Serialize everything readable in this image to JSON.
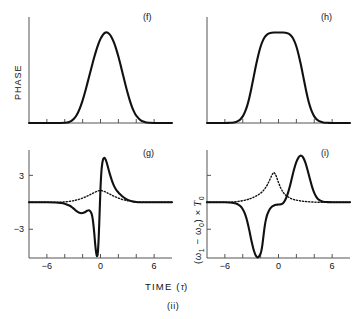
{
  "figure": {
    "caption": "(ii)",
    "axis_labels": {
      "y_top": "PHASE",
      "y_bottom_html": "(ω₁ − ω₀) × T₀",
      "x": "TIME (τ)"
    },
    "panel_tags": {
      "f": "(f)",
      "g": "(g)",
      "h": "(h)",
      "i": "(i)"
    },
    "tick_labels": {
      "x": [
        "−6",
        "0",
        "6"
      ],
      "y_bottom": [
        "3",
        "−3"
      ]
    },
    "colors": {
      "curve": "#111111",
      "axis": "#555555",
      "background": "#ffffff"
    }
  },
  "chart_data": [
    {
      "id": "f",
      "type": "line",
      "title": "(f)",
      "xlabel": "TIME (τ)",
      "ylabel": "PHASE",
      "xlim": [
        -8,
        8
      ],
      "ylim": [
        0,
        1.15
      ],
      "xticks": [
        -6,
        -4,
        -2,
        0,
        2,
        4,
        6
      ],
      "xticklabels": [
        "",
        "",
        "",
        "",
        "",
        "",
        ""
      ],
      "yticks": [],
      "grid": false,
      "legend": false,
      "description": "Gaussian phase profile exp(-tau^2) peaking at tau=0",
      "series": [
        {
          "name": "phase-gaussian",
          "style": "solid",
          "x": [
            -8.0,
            -7.5,
            -7.0,
            -6.5,
            -6.0,
            -5.5,
            -5.0,
            -4.5,
            -4.0,
            -3.75,
            -3.5,
            -3.25,
            -3.0,
            -2.75,
            -2.5,
            -2.25,
            -2.0,
            -1.75,
            -1.5,
            -1.25,
            -1.0,
            -0.75,
            -0.5,
            -0.25,
            0.0,
            0.25,
            0.5,
            0.75,
            1.0,
            1.25,
            1.5,
            1.75,
            2.0,
            2.25,
            2.5,
            2.75,
            3.0,
            3.25,
            3.5,
            3.75,
            4.0,
            4.5,
            5.0,
            5.5,
            6.0,
            6.5,
            7.0,
            7.5,
            8.0
          ],
          "y": [
            0.0,
            0.0,
            0.0,
            0.0,
            0.0,
            0.0,
            0.0,
            0.0,
            0.002,
            0.005,
            0.012,
            0.024,
            0.044,
            0.075,
            0.119,
            0.178,
            0.25,
            0.334,
            0.427,
            0.522,
            0.617,
            0.71,
            0.795,
            0.87,
            0.93,
            0.973,
            0.998,
            1.0,
            0.983,
            0.946,
            0.891,
            0.82,
            0.735,
            0.64,
            0.54,
            0.44,
            0.345,
            0.259,
            0.185,
            0.126,
            0.082,
            0.03,
            0.009,
            0.002,
            0.0,
            0.0,
            0.0,
            0.0,
            0.0
          ]
        }
      ]
    },
    {
      "id": "h",
      "type": "line",
      "title": "(h)",
      "xlabel": "TIME (τ)",
      "ylabel": "PHASE",
      "xlim": [
        -8,
        8
      ],
      "ylim": [
        0,
        1.15
      ],
      "xticks": [
        -6,
        -4,
        -2,
        0,
        2,
        4,
        6
      ],
      "xticklabels": [
        "",
        "",
        "",
        "",
        "",
        "",
        ""
      ],
      "yticks": [],
      "grid": false,
      "legend": false,
      "description": "Super-Gaussian phase profile, flat-topped plateau between tau=-1 and tau=1",
      "series": [
        {
          "name": "phase-super-gaussian",
          "style": "solid",
          "x": [
            -8.0,
            -7.0,
            -6.0,
            -5.5,
            -5.0,
            -4.75,
            -4.5,
            -4.25,
            -4.0,
            -3.75,
            -3.5,
            -3.25,
            -3.0,
            -2.75,
            -2.5,
            -2.25,
            -2.0,
            -1.75,
            -1.5,
            -1.25,
            -1.0,
            -0.5,
            0.0,
            0.5,
            1.0,
            1.25,
            1.5,
            1.75,
            2.0,
            2.25,
            2.5,
            2.75,
            3.0,
            3.25,
            3.5,
            3.75,
            4.0,
            4.25,
            4.5,
            5.0,
            5.5,
            6.0,
            7.0,
            8.0
          ],
          "y": [
            0.0,
            0.0,
            0.0,
            0.002,
            0.006,
            0.012,
            0.023,
            0.042,
            0.073,
            0.122,
            0.192,
            0.286,
            0.4,
            0.524,
            0.646,
            0.756,
            0.846,
            0.911,
            0.954,
            0.98,
            0.993,
            1.0,
            1.0,
            1.0,
            0.993,
            0.98,
            0.954,
            0.911,
            0.846,
            0.756,
            0.646,
            0.524,
            0.4,
            0.286,
            0.192,
            0.122,
            0.073,
            0.042,
            0.023,
            0.006,
            0.002,
            0.0,
            0.0,
            0.0
          ]
        }
      ]
    },
    {
      "id": "g",
      "type": "line",
      "title": "(g)",
      "xlabel": "TIME (τ)",
      "ylabel": "(ω₁ − ω₀) × T₀",
      "xlim": [
        -8,
        8
      ],
      "ylim": [
        -6.2,
        5.6
      ],
      "xticks": [
        -6,
        -4,
        -2,
        0,
        2,
        4,
        6
      ],
      "xticklabels": [
        "−6",
        "",
        "",
        "0",
        "",
        "",
        "6"
      ],
      "yticks": [
        -3,
        0,
        3
      ],
      "yticklabels": [
        "−3",
        "",
        "3"
      ],
      "grid": false,
      "legend": false,
      "description": "Frequency chirp for Gaussian pulse: antisymmetric solid curve with deep negative dip just before tau=0 and sharp positive peak just after; dotted curve is a small symmetric positive bump centred at tau=0",
      "series": [
        {
          "name": "chirp-solid",
          "style": "solid",
          "x": [
            -8.0,
            -7.0,
            -6.0,
            -5.0,
            -4.5,
            -4.0,
            -3.5,
            -3.25,
            -3.0,
            -2.75,
            -2.5,
            -2.25,
            -2.0,
            -1.75,
            -1.5,
            -1.25,
            -1.0,
            -0.85,
            -0.7,
            -0.6,
            -0.5,
            -0.4,
            -0.3,
            -0.2,
            -0.1,
            0.0,
            0.1,
            0.2,
            0.3,
            0.4,
            0.5,
            0.6,
            0.7,
            0.85,
            1.0,
            1.25,
            1.5,
            1.75,
            2.0,
            2.25,
            2.5,
            2.75,
            3.0,
            3.5,
            4.0,
            4.5,
            5.0,
            6.0,
            7.0,
            8.0
          ],
          "y": [
            0.0,
            0.0,
            0.0,
            -0.02,
            -0.06,
            -0.15,
            -0.35,
            -0.5,
            -0.7,
            -0.92,
            -1.1,
            -1.2,
            -1.2,
            -1.1,
            -0.95,
            -0.9,
            -1.25,
            -2.0,
            -3.4,
            -4.6,
            -5.5,
            -6.0,
            -5.6,
            -3.9,
            -1.2,
            1.6,
            3.4,
            4.35,
            4.8,
            4.95,
            4.9,
            4.7,
            4.4,
            3.85,
            3.3,
            2.5,
            1.85,
            1.4,
            1.1,
            0.85,
            0.62,
            0.44,
            0.3,
            0.12,
            0.04,
            0.01,
            0.0,
            0.0,
            0.0,
            0.0
          ]
        },
        {
          "name": "chirp-dotted",
          "style": "dotted",
          "x": [
            -8.0,
            -7.0,
            -6.0,
            -5.0,
            -4.5,
            -4.0,
            -3.5,
            -3.0,
            -2.75,
            -2.5,
            -2.25,
            -2.0,
            -1.75,
            -1.5,
            -1.25,
            -1.0,
            -0.75,
            -0.5,
            -0.25,
            0.0,
            0.25,
            0.5,
            0.75,
            1.0,
            1.25,
            1.5,
            1.75,
            2.0,
            2.25,
            2.5,
            2.75,
            3.0,
            3.5,
            4.0,
            4.5,
            5.0,
            6.0,
            7.0,
            8.0
          ],
          "y": [
            0.0,
            0.0,
            0.0,
            0.0,
            0.02,
            0.05,
            0.1,
            0.18,
            0.24,
            0.3,
            0.38,
            0.47,
            0.57,
            0.68,
            0.8,
            0.93,
            1.06,
            1.18,
            1.27,
            1.32,
            1.27,
            1.18,
            1.06,
            0.93,
            0.8,
            0.68,
            0.57,
            0.47,
            0.38,
            0.3,
            0.24,
            0.18,
            0.1,
            0.05,
            0.02,
            0.0,
            0.0,
            0.0,
            0.0
          ]
        }
      ]
    },
    {
      "id": "i",
      "type": "line",
      "title": "(i)",
      "xlabel": "TIME (τ)",
      "ylabel": "(ω₁ − ω₀) × T₀",
      "xlim": [
        -8,
        8
      ],
      "ylim": [
        -6.2,
        5.6
      ],
      "xticks": [
        -6,
        -4,
        -2,
        0,
        2,
        4,
        6
      ],
      "xticklabels": [
        "−6",
        "",
        "",
        "0",
        "",
        "",
        "6"
      ],
      "yticks": [
        -3,
        0,
        3
      ],
      "yticklabels": [
        "",
        "",
        ""
      ],
      "grid": false,
      "legend": false,
      "description": "Frequency chirp for super-Gaussian pulse: solid curve has a deep negative dip near tau=-2 and a tall positive peak near tau=+2.5, flat near tau=0; dotted curve peaks near tau=-0.5 with a tall narrow maximum",
      "series": [
        {
          "name": "chirp-solid",
          "style": "solid",
          "x": [
            -8.0,
            -7.0,
            -6.0,
            -5.5,
            -5.0,
            -4.75,
            -4.5,
            -4.25,
            -4.0,
            -3.75,
            -3.5,
            -3.25,
            -3.0,
            -2.75,
            -2.5,
            -2.25,
            -2.0,
            -1.9,
            -1.8,
            -1.7,
            -1.6,
            -1.5,
            -1.4,
            -1.25,
            -1.0,
            -0.75,
            -0.5,
            -0.25,
            0.0,
            0.25,
            0.5,
            0.75,
            1.0,
            1.25,
            1.5,
            1.75,
            2.0,
            2.25,
            2.4,
            2.5,
            2.6,
            2.75,
            3.0,
            3.25,
            3.5,
            3.75,
            4.0,
            4.25,
            4.5,
            5.0,
            5.5,
            6.0,
            7.0,
            8.0
          ],
          "y": [
            0.0,
            0.0,
            0.0,
            -0.02,
            -0.07,
            -0.14,
            -0.26,
            -0.45,
            -0.78,
            -1.3,
            -2.1,
            -3.2,
            -4.4,
            -5.4,
            -6.0,
            -6.1,
            -5.7,
            -5.3,
            -4.7,
            -3.9,
            -3.1,
            -2.4,
            -1.9,
            -1.35,
            -0.8,
            -0.5,
            -0.35,
            -0.28,
            -0.25,
            -0.22,
            -0.1,
            0.25,
            0.85,
            1.7,
            2.7,
            3.7,
            4.5,
            5.0,
            5.15,
            5.2,
            5.15,
            5.0,
            4.45,
            3.6,
            2.65,
            1.75,
            1.05,
            0.58,
            0.3,
            0.07,
            0.02,
            0.0,
            0.0,
            0.0
          ]
        },
        {
          "name": "chirp-dotted",
          "style": "dotted",
          "x": [
            -8.0,
            -7.0,
            -6.0,
            -5.5,
            -5.0,
            -4.5,
            -4.0,
            -3.5,
            -3.25,
            -3.0,
            -2.75,
            -2.5,
            -2.25,
            -2.0,
            -1.75,
            -1.5,
            -1.25,
            -1.0,
            -0.75,
            -0.6,
            -0.5,
            -0.4,
            -0.25,
            0.0,
            0.25,
            0.5,
            0.75,
            1.0,
            1.25,
            1.5,
            1.75,
            2.0,
            2.5,
            3.0,
            3.5,
            4.0,
            4.5,
            5.0,
            6.0,
            7.0,
            8.0
          ],
          "y": [
            0.0,
            0.0,
            0.0,
            0.02,
            0.05,
            0.1,
            0.18,
            0.3,
            0.38,
            0.47,
            0.58,
            0.7,
            0.85,
            1.02,
            1.25,
            1.55,
            1.95,
            2.45,
            3.0,
            3.25,
            3.3,
            3.2,
            2.9,
            2.2,
            1.6,
            1.15,
            0.85,
            0.65,
            0.5,
            0.38,
            0.3,
            0.24,
            0.15,
            0.09,
            0.05,
            0.02,
            0.01,
            0.0,
            0.0,
            0.0,
            0.0
          ]
        }
      ]
    }
  ]
}
